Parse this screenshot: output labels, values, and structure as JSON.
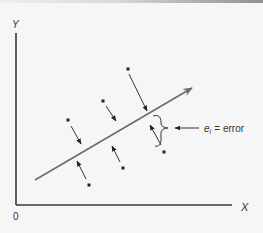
{
  "figure": {
    "type": "regression-error-diagram",
    "axes": {
      "y_label": "Y",
      "x_label": "X",
      "origin_label": "0"
    },
    "annotation": {
      "symbol": "e",
      "subscript": "i",
      "equals": "=",
      "text": "error"
    },
    "regression_line": {
      "from": [
        35,
        180
      ],
      "to": [
        192,
        88
      ],
      "color": "#6b6b6b"
    },
    "points": [
      {
        "x": 128,
        "y": 69,
        "arrow_to": [
          147,
          111
        ]
      },
      {
        "x": 103,
        "y": 101,
        "arrow_to": [
          116,
          121
        ]
      },
      {
        "x": 68,
        "y": 120,
        "arrow_to": [
          81,
          144
        ]
      },
      {
        "x": 164,
        "y": 152,
        "arrow_to": [
          150,
          125
        ]
      },
      {
        "x": 123,
        "y": 168,
        "arrow_to": [
          112,
          146
        ]
      },
      {
        "x": 89,
        "y": 185,
        "arrow_to": [
          77,
          161
        ]
      }
    ],
    "colors": {
      "background": "#f6f6f6",
      "axis": "#3a3a3a",
      "ink": "#222222"
    }
  }
}
